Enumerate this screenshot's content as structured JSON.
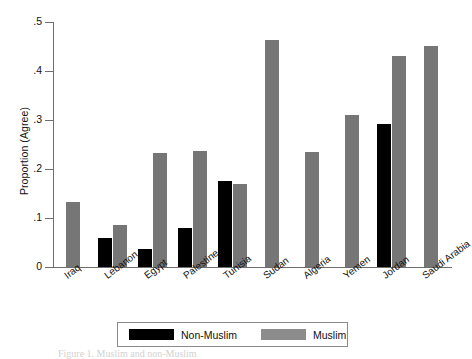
{
  "chart_data": {
    "type": "bar",
    "title": "",
    "xlabel": "",
    "ylabel": "Proportion (Agree)",
    "ylim": [
      0,
      0.5
    ],
    "yticks": [
      "0",
      ".1",
      ".2",
      ".3",
      ".4",
      ".5"
    ],
    "ytick_values": [
      0,
      0.1,
      0.2,
      0.3,
      0.4,
      0.5
    ],
    "grid": false,
    "legend_position": "bottom",
    "categories": [
      "Iraq",
      "Lebanon",
      "Egypt",
      "Palestine",
      "Tunisia",
      "Sudan",
      "Algeria",
      "Yemen",
      "Jordan",
      "Saudi Arabia"
    ],
    "series": [
      {
        "name": "Non-Muslim",
        "color": "#000000",
        "values": [
          null,
          0.06,
          0.036,
          0.08,
          0.175,
          null,
          null,
          null,
          0.292,
          null
        ]
      },
      {
        "name": "Muslim",
        "color": "#767676",
        "values": [
          0.132,
          0.086,
          0.233,
          0.237,
          0.169,
          0.463,
          0.235,
          0.311,
          0.431,
          0.451
        ]
      }
    ]
  },
  "axes": {
    "y_label": "Proportion (Agree)"
  },
  "legend": {
    "entries": [
      {
        "label": "Non-Muslim",
        "color": "#000000"
      },
      {
        "label": "Muslim",
        "color": "#8c8c8c"
      }
    ]
  },
  "caption": {
    "text": "Figure 1. Muslim and non-Muslim"
  }
}
